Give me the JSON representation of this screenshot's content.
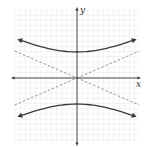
{
  "chart_data": {
    "type": "line",
    "title": "",
    "xlabel": "x",
    "ylabel": "y",
    "grid": true,
    "xlim": [
      -12,
      12
    ],
    "ylim": [
      -13,
      13
    ],
    "series": [
      {
        "name": "hyperbola-upper-branch",
        "style": "solid",
        "arrows": "both-ends",
        "x": [
          -11.5,
          -8,
          -4,
          0,
          4,
          8,
          11.5
        ],
        "y": [
          7.5,
          6.3,
          5.4,
          5.0,
          5.4,
          6.3,
          7.5
        ]
      },
      {
        "name": "hyperbola-lower-branch",
        "style": "solid",
        "arrows": "both-ends",
        "x": [
          -11.5,
          -8,
          -4,
          0,
          4,
          8,
          11.5
        ],
        "y": [
          -7.5,
          -6.3,
          -5.4,
          -5.0,
          -5.4,
          -6.3,
          -7.5
        ]
      },
      {
        "name": "asymptote-positive-slope",
        "style": "dashed",
        "x": [
          -12,
          12
        ],
        "y": [
          -5.2,
          5.2
        ]
      },
      {
        "name": "asymptote-negative-slope",
        "style": "dashed",
        "x": [
          -12,
          12
        ],
        "y": [
          5.2,
          -5.2
        ]
      }
    ],
    "colors": {
      "curve": "#3a3a3a",
      "asymptote": "#8a8a8a",
      "axis": "#333333",
      "grid": "#e4e4e4"
    }
  },
  "axes": {
    "x_label": "x",
    "y_label": "y"
  }
}
